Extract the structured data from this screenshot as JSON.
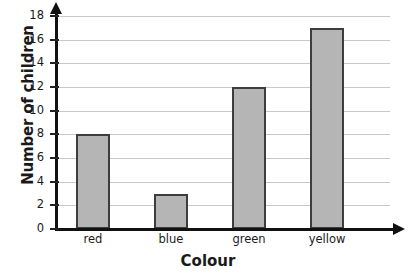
{
  "chart_data": {
    "type": "bar",
    "title": "",
    "subtitle": "",
    "xlabel": "Colour",
    "ylabel": "Number of children",
    "categories": [
      "red",
      "blue",
      "green",
      "yellow"
    ],
    "values": [
      8,
      3,
      12,
      17
    ],
    "series": [
      {
        "name": "Number of children",
        "values": [
          8,
          3,
          12,
          17
        ]
      }
    ],
    "ylim": [
      0,
      18
    ],
    "ytick_labels": [
      "0",
      "2",
      "4",
      "6",
      "8",
      "10",
      "12",
      "14",
      "16",
      "18"
    ],
    "ytick_values": [
      0,
      2,
      4,
      6,
      8,
      10,
      12,
      14,
      16,
      18
    ],
    "grid": "horizontal",
    "legend": "none",
    "annotations": [],
    "colors": {
      "bar_fill": "#b5b5b5",
      "bar_stroke": "#3d3d3d",
      "gridline": "#c9c9c9",
      "axis": "#111111",
      "text": "#1a1a1a",
      "background": "#ffffff"
    }
  }
}
